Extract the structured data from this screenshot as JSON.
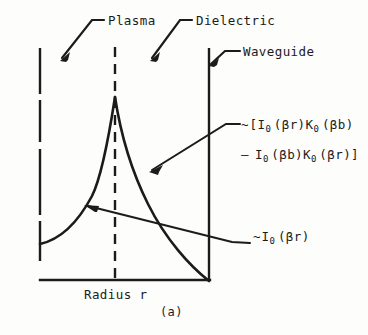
{
  "figure": {
    "panel_label": "(a)",
    "axis": {
      "x_label": "Radius r"
    },
    "annotations": {
      "plasma": "Plasma",
      "dielectric": "Dielectric",
      "waveguide": "Waveguide",
      "formula_line1": {
        "tilde": "~",
        "open_bracket": "[",
        "term1_fn": "I",
        "term1_sub": "0",
        "term1_arg": "(βr)",
        "term2_fn": "K",
        "term2_sub": "0",
        "term2_arg": "(βb)"
      },
      "formula_line2": {
        "minus": "–",
        "term1_fn": "I",
        "term1_sub": "0",
        "term1_arg": "(βb)",
        "term2_fn": "K",
        "term2_sub": "0",
        "term2_arg": "(βr)",
        "close_bracket": "]"
      },
      "i0_label": {
        "tilde": "~",
        "fn": "I",
        "sub": "0",
        "arg": "(βr)"
      }
    },
    "colors": {
      "ink": "#1b1b1b",
      "background": "#fdfdfb"
    },
    "curve_description": {
      "type": "line",
      "series": [
        {
          "name": "plasma-region-I0(βr)",
          "comment": "rising modified Bessel I0 profile from inner boundary to plasma/dielectric interface peak",
          "points": [
            [
              40,
              244
            ],
            [
              52,
              238
            ],
            [
              64,
              229
            ],
            [
              76,
              214
            ],
            [
              88,
              194
            ],
            [
              96,
              174
            ],
            [
              104,
              146
            ],
            [
              110,
              118
            ],
            [
              115,
              98
            ]
          ]
        },
        {
          "name": "dielectric-region-bracket-term",
          "comment": "decaying combination I0(βr)K0(βb) - I0(βb)K0(βr) falling to zero at the waveguide wall",
          "points": [
            [
              115,
              98
            ],
            [
              122,
              128
            ],
            [
              130,
              158
            ],
            [
              140,
              186
            ],
            [
              152,
              212
            ],
            [
              168,
              238
            ],
            [
              186,
              258
            ],
            [
              200,
              272
            ],
            [
              209,
              280
            ]
          ]
        }
      ]
    }
  }
}
